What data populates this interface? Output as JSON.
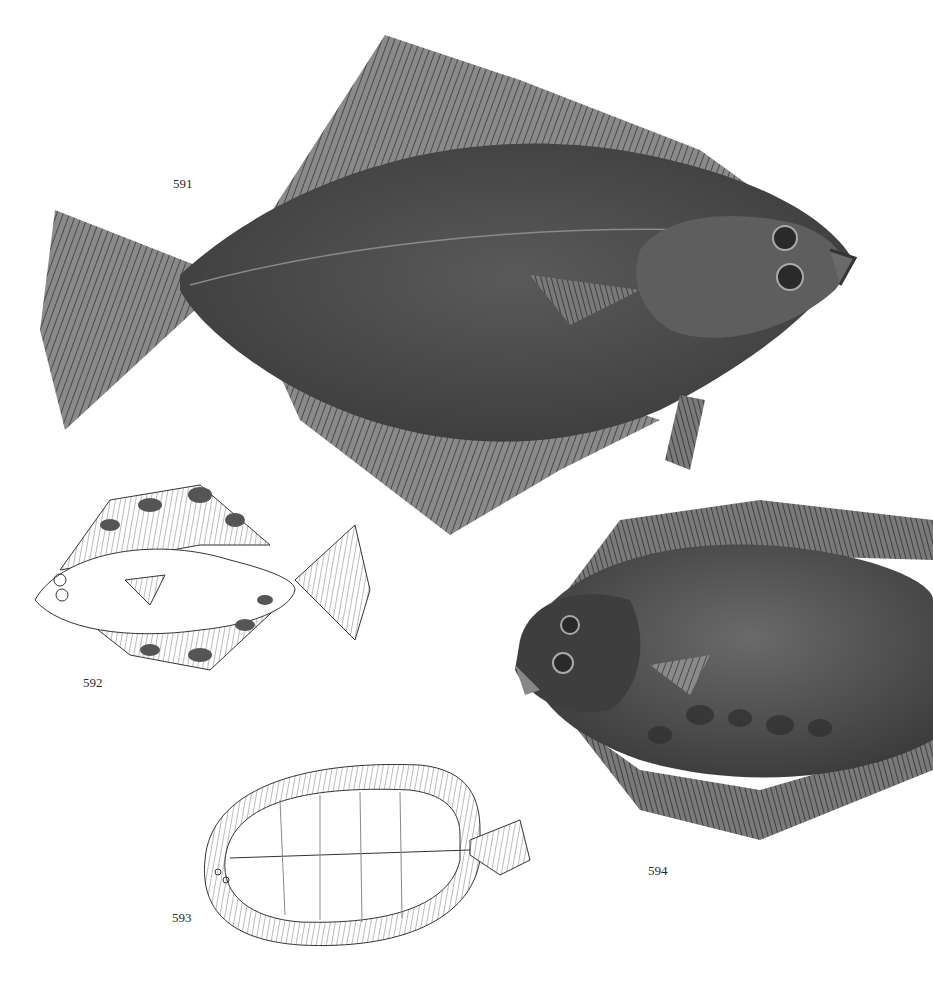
{
  "plate": {
    "figures": [
      {
        "number": "591",
        "style": "shaded illustration",
        "orientation": "head right"
      },
      {
        "number": "592",
        "style": "line drawing with dark blotches",
        "orientation": "head left"
      },
      {
        "number": "593",
        "style": "line drawing, outline",
        "orientation": "head left"
      },
      {
        "number": "594",
        "style": "shaded illustration",
        "orientation": "head left"
      }
    ]
  },
  "labels": {
    "fig591": "591",
    "fig592": "592",
    "fig593": "593",
    "fig594": "594"
  },
  "colors": {
    "background": "#ffffff",
    "body_dark": "#4a4a4a",
    "fin": "#6a6a6a",
    "line": "#333333"
  }
}
